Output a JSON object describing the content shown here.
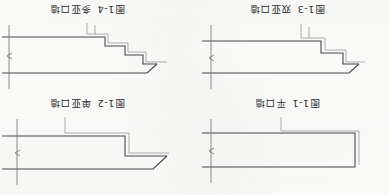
{
  "page": {
    "background_color": "#fdfdfc",
    "ink_color": "#4a4a4a",
    "orientation_note": "180",
    "width": 389,
    "height": 195
  },
  "figures": [
    {
      "id": "fig-1-1",
      "number": "图1-1",
      "title": "平口墙",
      "type": "flat-opening-wall",
      "steps": 0
    },
    {
      "id": "fig-1-2",
      "number": "图1-2",
      "title": "单亚口墙",
      "type": "single-step-opening-wall",
      "steps": 1
    },
    {
      "id": "fig-1-3",
      "number": "图1-3",
      "title": "双亚口墙",
      "type": "double-step-opening-wall",
      "steps": 2
    },
    {
      "id": "fig-1-4",
      "number": "图1-4",
      "title": "多亚口墙",
      "type": "multi-step-opening-wall",
      "steps": 3
    }
  ]
}
